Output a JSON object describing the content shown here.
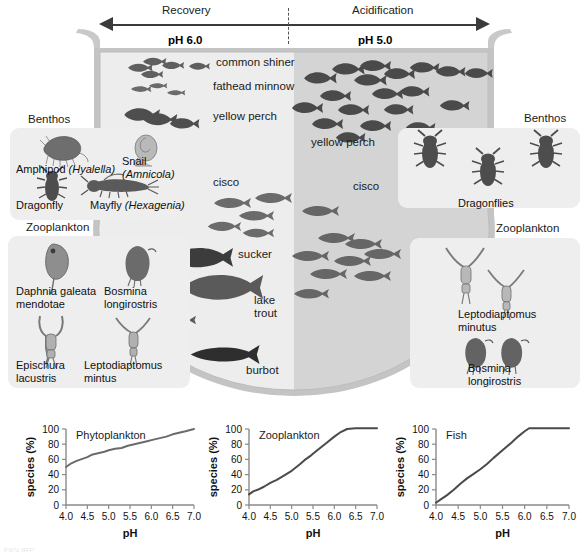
{
  "figure": {
    "caption": "FIGURE"
  },
  "axis": {
    "left_label": "Recovery",
    "right_label": "Acidification",
    "left_ph": "pH 6.0",
    "right_ph": "pH 5.0"
  },
  "basin": {
    "water_left_color": "#ededed",
    "water_right_color": "#d4d4d4",
    "rim_color": "#c9c9c9",
    "outline_color": "#b4b4b4"
  },
  "lake_labels": {
    "left": [
      {
        "text": "common shiner",
        "x": 216,
        "y": 62
      },
      {
        "text": "fathead minnow",
        "x": 213,
        "y": 85
      },
      {
        "text": "yellow perch",
        "x": 213,
        "y": 115
      },
      {
        "text": "cisco",
        "x": 213,
        "y": 181
      },
      {
        "text": "sucker",
        "x": 238,
        "y": 252
      },
      {
        "text": "lake",
        "x": 254,
        "y": 296
      },
      {
        "text": "trout",
        "x": 254,
        "y": 309
      },
      {
        "text": "burbot",
        "x": 246,
        "y": 367
      }
    ],
    "right": [
      {
        "text": "yellow perch",
        "x": 314,
        "y": 141
      },
      {
        "text": "cisco",
        "x": 355,
        "y": 184
      }
    ]
  },
  "callouts": {
    "benthos_left": {
      "title": "Benthos",
      "species": [
        {
          "name": "Amphipod",
          "latin": "(Hyalella)"
        },
        {
          "name": "Snail",
          "latin": "(Amnicola)"
        },
        {
          "name": "Dragonfly",
          "latin": ""
        },
        {
          "name": "Mayfly",
          "latin": "(Hexagenia)"
        }
      ]
    },
    "zooplankton_left": {
      "title": "Zooplankton",
      "species": [
        {
          "line1": "Daphnia galeata",
          "line2": "mendotae"
        },
        {
          "line1": "Bosmina",
          "line2": "longirostris"
        },
        {
          "line1": "Epischura",
          "line2": "lacustris"
        },
        {
          "line1": "Leptodiaptomus",
          "line2": "mintus"
        }
      ]
    },
    "benthos_right": {
      "title": "Benthos",
      "species": [
        {
          "line1": "Dragonflies",
          "line2": ""
        }
      ]
    },
    "zooplankton_right": {
      "title": "Zooplankton",
      "species": [
        {
          "line1": "Leptodiaptomus",
          "line2": "minutus"
        },
        {
          "line1": "Bosmina",
          "line2": "longirostris"
        }
      ]
    }
  },
  "chart_data": [
    {
      "type": "line",
      "title": "Phytoplankton",
      "xlabel": "pH",
      "ylabel": "species (%)",
      "xlim": [
        4.0,
        7.0
      ],
      "ylim": [
        0,
        100
      ],
      "xticks": [
        "4.0",
        "4.5",
        "5.0",
        "5.5",
        "6.0",
        "6.5",
        "7.0"
      ],
      "yticks": [
        "0",
        "20",
        "40",
        "60",
        "80",
        "100"
      ],
      "grid": false,
      "legend": "none",
      "line_color": "#6b6b6b",
      "x": [
        4.0,
        4.1,
        4.25,
        4.4,
        4.5,
        4.6,
        4.75,
        4.9,
        5.0,
        5.15,
        5.3,
        5.45,
        5.6,
        5.75,
        5.9,
        6.05,
        6.2,
        6.35,
        6.5,
        6.65,
        6.8,
        7.0
      ],
      "values": [
        50,
        54,
        58,
        61,
        63,
        66,
        68,
        70,
        72,
        74,
        75,
        78,
        80,
        82,
        84,
        86,
        88,
        90,
        93,
        95,
        97,
        100
      ]
    },
    {
      "type": "line",
      "title": "Zooplankton",
      "xlabel": "pH",
      "ylabel": "species (%)",
      "xlim": [
        4.0,
        7.0
      ],
      "ylim": [
        0,
        100
      ],
      "xticks": [
        "4.0",
        "4.5",
        "5.0",
        "5.5",
        "6.0",
        "6.5",
        "7.0"
      ],
      "yticks": [
        "0",
        "20",
        "40",
        "60",
        "80",
        "100"
      ],
      "grid": false,
      "legend": "none",
      "line_color": "#4a4a4a",
      "x": [
        4.0,
        4.1,
        4.2,
        4.35,
        4.5,
        4.65,
        4.8,
        5.0,
        5.2,
        5.3,
        5.45,
        5.6,
        5.8,
        6.0,
        6.15,
        6.3,
        6.5,
        6.75,
        7.0
      ],
      "values": [
        14,
        18,
        20,
        24,
        29,
        33,
        38,
        45,
        54,
        59,
        65,
        72,
        81,
        90,
        96,
        100,
        101,
        101,
        101
      ]
    },
    {
      "type": "line",
      "title": "Fish",
      "xlabel": "pH",
      "ylabel": "species (%)",
      "xlim": [
        4.0,
        7.0
      ],
      "ylim": [
        0,
        100
      ],
      "xticks": [
        "4.0",
        "4.5",
        "5.0",
        "5.5",
        "6.0",
        "6.5",
        "7.0"
      ],
      "yticks": [
        "0",
        "20",
        "40",
        "60",
        "80",
        "100"
      ],
      "grid": false,
      "legend": "none",
      "line_color": "#4a4a4a",
      "x": [
        4.0,
        4.1,
        4.25,
        4.4,
        4.55,
        4.7,
        4.85,
        5.0,
        5.15,
        5.3,
        5.5,
        5.7,
        5.85,
        6.0,
        6.1,
        6.3,
        6.6,
        7.0
      ],
      "values": [
        3,
        7,
        13,
        20,
        28,
        35,
        41,
        47,
        54,
        62,
        72,
        82,
        90,
        97,
        101,
        101,
        101,
        101
      ]
    }
  ]
}
